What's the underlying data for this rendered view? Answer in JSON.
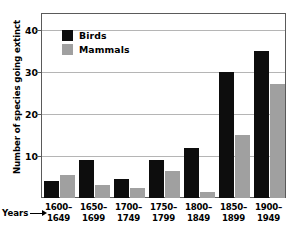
{
  "chart_data": {
    "type": "bar",
    "title": "",
    "xlabel": "Years",
    "ylabel": "Number of species going extinct",
    "categories": [
      "1600–1649",
      "1650–1699",
      "1700–1749",
      "1750–1799",
      "1800–1849",
      "1850–1899",
      "1900–1949"
    ],
    "category_lines": [
      [
        "1600–",
        "1649"
      ],
      [
        "1650–",
        "1699"
      ],
      [
        "1700–",
        "1749"
      ],
      [
        "1750–",
        "1799"
      ],
      [
        "1800–",
        "1849"
      ],
      [
        "1850–",
        "1899"
      ],
      [
        "1900–",
        "1949"
      ]
    ],
    "series": [
      {
        "name": "Birds",
        "color": "#0d0d0d",
        "values": [
          4,
          9,
          4.5,
          9,
          12,
          30,
          35
        ]
      },
      {
        "name": "Mammals",
        "color": "#a0a0a0",
        "values": [
          5.5,
          3,
          2.5,
          6.5,
          1.5,
          15,
          27
        ]
      }
    ],
    "ylim": [
      0,
      44
    ],
    "yticks": [
      10,
      20,
      30,
      40
    ],
    "ytick_labels": [
      "10",
      "20",
      "30",
      "40"
    ],
    "grid": true,
    "legend_position": "upper-left-inside"
  },
  "legend": {
    "items": [
      {
        "label": "Birds"
      },
      {
        "label": "Mammals"
      }
    ]
  },
  "axes": {
    "y_title": "Number of species going extinct",
    "x_caption": "Years",
    "x_caption_arrow_icon": "right-arrow-icon"
  }
}
